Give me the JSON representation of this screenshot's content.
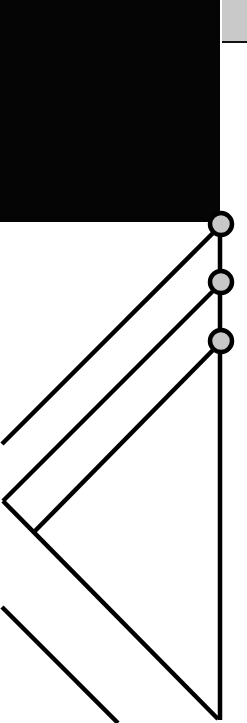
{
  "diagram": {
    "canvas": {
      "width": 247,
      "height": 723,
      "background": "#ffffff"
    },
    "colors": {
      "block_fill": "#050505",
      "strip_fill": "#c9c9c9",
      "node_fill": "#c8c8c8",
      "stroke": "#000000"
    },
    "block": {
      "x": 0,
      "y": 0,
      "w": 220,
      "h": 222
    },
    "strip": {
      "x": 222,
      "y": 0,
      "w": 25,
      "h": 41
    },
    "spine": {
      "x": 220,
      "y1": 223,
      "y2": 720
    },
    "nodes": [
      {
        "id": "node-1",
        "cx": 221,
        "cy": 224,
        "r": 11
      },
      {
        "id": "node-2",
        "cx": 221,
        "cy": 282,
        "r": 11
      },
      {
        "id": "node-3",
        "cx": 221,
        "cy": 341,
        "r": 11
      }
    ],
    "edges": [
      {
        "id": "edge-node1-left",
        "x1": 215,
        "y1": 231,
        "x2": 2,
        "y2": 444
      },
      {
        "id": "edge-node2-vertex",
        "x1": 215,
        "y1": 289,
        "x2": 3,
        "y2": 501
      },
      {
        "id": "edge-node3-junction",
        "x1": 215,
        "y1": 348,
        "x2": 35,
        "y2": 531
      },
      {
        "id": "edge-vertex-bottom",
        "x1": 3,
        "y1": 501,
        "x2": 218,
        "y2": 719
      },
      {
        "id": "edge-lower",
        "x1": 2,
        "y1": 607,
        "x2": 118,
        "y2": 723
      }
    ]
  }
}
